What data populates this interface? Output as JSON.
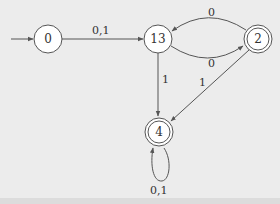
{
  "diagram": {
    "type": "finite-automaton",
    "start_state": "0",
    "states": [
      {
        "id": "0",
        "label": "0",
        "accepting": false,
        "x": 48,
        "y": 39
      },
      {
        "id": "13",
        "label": "13",
        "accepting": false,
        "x": 158,
        "y": 39
      },
      {
        "id": "2",
        "label": "2",
        "accepting": true,
        "x": 258,
        "y": 39
      },
      {
        "id": "4",
        "label": "4",
        "accepting": true,
        "x": 159,
        "y": 132
      }
    ],
    "transitions": [
      {
        "from": "0",
        "to": "13",
        "label": "0,1"
      },
      {
        "from": "2",
        "to": "13",
        "label": "0"
      },
      {
        "from": "13",
        "to": "2",
        "label": "0"
      },
      {
        "from": "13",
        "to": "4",
        "label": "1"
      },
      {
        "from": "2",
        "to": "4",
        "label": "1"
      },
      {
        "from": "4",
        "to": "4",
        "label": "0,1"
      }
    ]
  },
  "labels": {
    "s0": "0",
    "s13": "13",
    "s2": "2",
    "s4": "4",
    "e_0_13": "0,1",
    "e_2_13": "0",
    "e_13_2": "0",
    "e_13_4": "1",
    "e_2_4": "1",
    "e_4_4": "0,1"
  },
  "colors": {
    "background": "#ececec",
    "stroke": "#555555",
    "node_fill": "#ffffff",
    "text": "#333333"
  }
}
